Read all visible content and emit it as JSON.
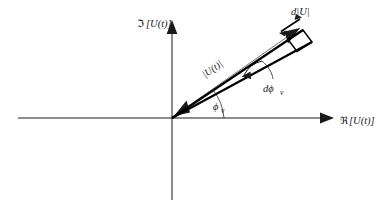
{
  "figure": {
    "type": "diagram",
    "background_color": "#ffffff",
    "line_color": "#000000",
    "axes": {
      "imaginary": {
        "label_operator": "ℑ",
        "label_argument": "[U(t)]",
        "label_full": "ℑ[U(t)]",
        "direction": "vertical",
        "arrow": "up"
      },
      "real": {
        "label_operator": "ℜ",
        "label_argument": "[U(t)]",
        "label_full": "ℜ[U(t)]",
        "direction": "horizontal",
        "arrow": "right"
      },
      "origin_label": ""
    },
    "annotations": {
      "magnitude": {
        "text": "|U(t)|",
        "description": "magnitude of the phasor, labelled along the thin reference line",
        "rotated": true
      },
      "d_magnitude": {
        "text": "d|U|",
        "description": "differential change in magnitude, double headed arrow at vector tip"
      },
      "d_phase": {
        "text_main": "dϕ",
        "text_sub": "v",
        "text_full": "dϕv",
        "description": "differential change in phase angle, curved arrow between the two phasors"
      },
      "phase": {
        "text_main": "ϕ",
        "text_sub": "v",
        "text_full": "ϕv",
        "description": "phase angle of the phasor measured from the real axis"
      }
    },
    "vectors": [
      {
        "name": "phasor-lower",
        "angle_deg": 31,
        "style": "thick",
        "from": "origin"
      },
      {
        "name": "phasor-upper",
        "angle_deg": 35,
        "style": "thick",
        "from": "origin"
      },
      {
        "name": "magnitude-reference",
        "angle_deg": 35,
        "style": "thin double-headed",
        "from": "origin"
      }
    ],
    "differential_element": {
      "shape": "parallelogram",
      "description": "small parallelogram at the phasor tip spanned by d|U| and |U|dϕv"
    }
  }
}
